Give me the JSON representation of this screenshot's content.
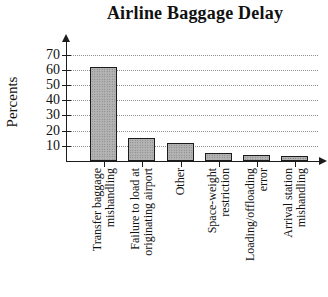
{
  "title": "Airline Baggage Delay",
  "chart_data": {
    "type": "bar",
    "title": "Airline Baggage Delay",
    "xlabel": "",
    "ylabel": "Percents",
    "categories": [
      "Transfer baggage mishandling",
      "Failure to load at originating airport",
      "Other",
      "Space-weight restriction",
      "Loading/offloading error",
      "Arrival station mishandling"
    ],
    "category_lines": [
      [
        "Transfer baggage",
        "mishandling"
      ],
      [
        "Failure to load at",
        "originating airport"
      ],
      [
        "Other"
      ],
      [
        "Space-weight",
        "restriction"
      ],
      [
        "Loading/offloading",
        "error"
      ],
      [
        "Arrival station",
        "mishandling"
      ]
    ],
    "values": [
      62,
      15,
      12,
      5,
      4,
      3
    ],
    "yticks": [
      10,
      20,
      30,
      40,
      50,
      60,
      70
    ],
    "ylim": [
      0,
      75
    ],
    "grid": "horizontal-dotted",
    "legend_position": "none",
    "colors": {
      "bar_fill": "#b3b3b3",
      "bar_stipple": "#7a7a7a",
      "bar_border": "#1b1b1b",
      "gridline": "#8f8f8f",
      "axis": "#1c1c1c",
      "text": "#111111",
      "background": "#ffffff"
    }
  }
}
